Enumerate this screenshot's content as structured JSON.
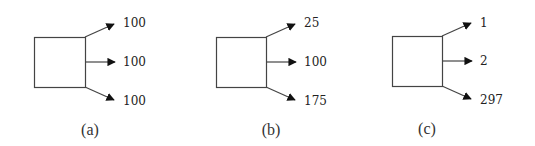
{
  "diagram": {
    "panels": [
      {
        "caption": "(a)",
        "outputs": [
          {
            "position": "top",
            "value": "100"
          },
          {
            "position": "middle",
            "value": "100"
          },
          {
            "position": "bottom",
            "value": "100"
          }
        ]
      },
      {
        "caption": "(b)",
        "outputs": [
          {
            "position": "top",
            "value": "25"
          },
          {
            "position": "middle",
            "value": "100"
          },
          {
            "position": "bottom",
            "value": "175"
          }
        ]
      },
      {
        "caption": "(c)",
        "outputs": [
          {
            "position": "top",
            "value": "1"
          },
          {
            "position": "middle",
            "value": "2"
          },
          {
            "position": "bottom",
            "value": "297"
          }
        ]
      }
    ],
    "colors": {
      "stroke": "#444444",
      "arrowhead": "#111111",
      "text": "#222222"
    }
  }
}
